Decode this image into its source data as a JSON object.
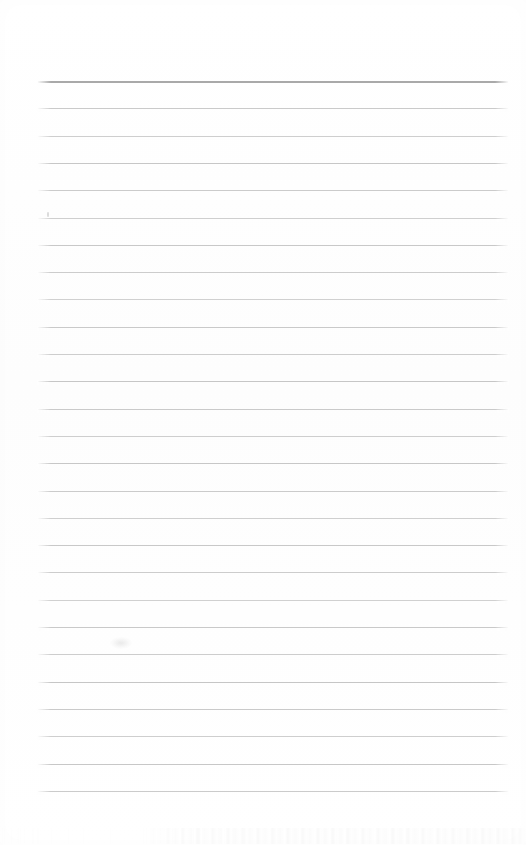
{
  "document": {
    "kind": "scanned-lined-notebook-page",
    "title": "Blank ruled page",
    "content_text": "",
    "page_width": 526,
    "page_height": 845,
    "background_color": "#fefefe"
  },
  "ruling": {
    "line_color": "#c9c9c9",
    "header_line_color": "#aeaeae",
    "line_left_x": 38,
    "line_right_x": 508,
    "line_width": 470,
    "line_spacing": 27.3,
    "first_line_y": 81,
    "last_line_y": 797,
    "line_count": 27,
    "header_line_index": 0,
    "header_line_thickness": 2,
    "regular_line_thickness": 1,
    "lines_y": [
      81,
      108.3,
      135.6,
      162.9,
      190.2,
      217.5,
      244.8,
      272.1,
      299.4,
      326.7,
      354,
      381.3,
      408.6,
      435.9,
      463.2,
      490.5,
      517.8,
      545.1,
      572.4,
      599.7,
      627,
      654.3,
      681.6,
      708.9,
      736.2,
      763.5,
      790.8
    ]
  },
  "artifacts": [
    {
      "name": "ink-dot-near-line-6",
      "type": "dot",
      "x": 47,
      "y": 212
    },
    {
      "name": "paper-smudge-mid-page",
      "type": "smudge",
      "x": 110,
      "y": 637
    }
  ],
  "ghost_band": {
    "name": "bleed-through-ghost-text",
    "y": 828,
    "height": 16
  },
  "margins": {
    "top_blank_height": 81,
    "bottom_blank_height": 48,
    "left_blank_width": 38,
    "right_blank_width": 18
  }
}
